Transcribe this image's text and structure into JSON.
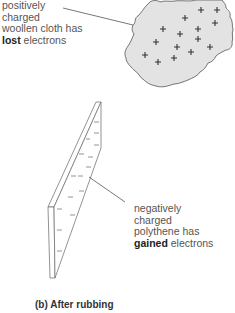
{
  "diagram": {
    "cloth_label": {
      "line1": "positively",
      "line2": "charged",
      "line3": "woollen cloth has",
      "bold": "lost",
      "rest": " electrons"
    },
    "strip_label": {
      "line1": "negatively",
      "line2": "charged",
      "line3": "polythene has",
      "bold": "gained",
      "rest": " electrons"
    },
    "caption": "(b) After rubbing",
    "cloth": {
      "fill": "#e4e4e4",
      "stroke": "#666666",
      "charge_symbol": "+",
      "charge_count": 15
    },
    "strip": {
      "stroke": "#777777",
      "charge_symbol": "−",
      "charge_count": 13
    }
  }
}
